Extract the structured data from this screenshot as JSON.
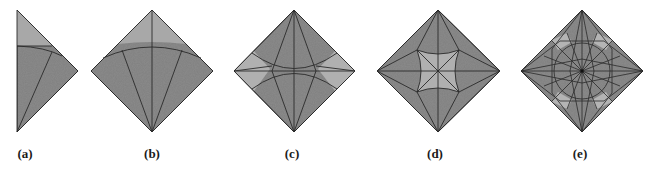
{
  "figure": {
    "panels": [
      {
        "id": "a",
        "label": "(a)",
        "label_x": 25
      },
      {
        "id": "b",
        "label": "(b)",
        "label_x": 152
      },
      {
        "id": "c",
        "label": "(c)",
        "label_x": 292
      },
      {
        "id": "d",
        "label": "(d)",
        "label_x": 435
      },
      {
        "id": "e",
        "label": "(e)",
        "label_x": 580
      }
    ],
    "colors": {
      "paper_dark": "#8c8c8c",
      "paper_light": "#b4b4b4",
      "crease": "#2a2a2a",
      "background": "#ffffff"
    }
  }
}
